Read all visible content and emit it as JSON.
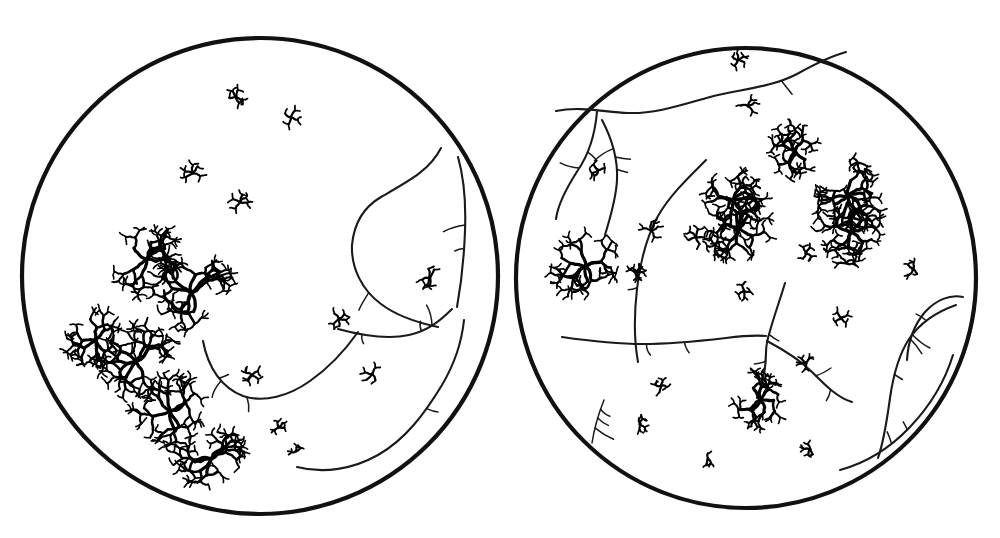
{
  "figure": {
    "background_color": "#ffffff",
    "ink_color": "#111111",
    "width": 1000,
    "height": 538,
    "caption": "",
    "labels": []
  },
  "fields": [
    {
      "id": "left-field",
      "name": "Left field of view",
      "center_x": 260,
      "center_y": 276,
      "radius": 238,
      "outline_width": 4.2,
      "cell_count": 16,
      "vessel_count": 4
    },
    {
      "id": "right-field",
      "name": "Right field of view",
      "center_x": 746,
      "center_y": 278,
      "radius": 230,
      "outline_width": 4.2,
      "cell_count": 25,
      "vessel_count": 7
    }
  ],
  "chart_data": {
    "type": "scatter",
    "xlabel": "",
    "ylabel": "",
    "legend": [
      {
        "key": "dense-cluster",
        "label": "Dense dendritic cell (highly ramified)"
      },
      {
        "key": "sparse-cell",
        "label": "Sparse stellate cell (few processes)"
      },
      {
        "key": "vessel",
        "label": "Blood vessel / fibre tract"
      }
    ],
    "series": [
      {
        "name": "left-field-cells",
        "field": "left-field",
        "points": [
          {
            "x": 236,
            "y": 97,
            "size": 1.0,
            "kind": "sparse-cell",
            "arms": 5,
            "rot": 14
          },
          {
            "x": 291,
            "y": 117,
            "size": 1.05,
            "kind": "sparse-cell",
            "arms": 4,
            "rot": 200
          },
          {
            "x": 193,
            "y": 173,
            "size": 1.15,
            "kind": "sparse-cell",
            "arms": 5,
            "rot": 120
          },
          {
            "x": 240,
            "y": 202,
            "size": 1.1,
            "kind": "sparse-cell",
            "arms": 5,
            "rot": 255
          },
          {
            "x": 147,
            "y": 259,
            "size": 2.45,
            "kind": "dense-cluster",
            "arms": 7,
            "rot": 30
          },
          {
            "x": 191,
            "y": 293,
            "size": 2.7,
            "kind": "dense-cluster",
            "arms": 8,
            "rot": 95
          },
          {
            "x": 96,
            "y": 341,
            "size": 1.95,
            "kind": "dense-cluster",
            "arms": 6,
            "rot": 210
          },
          {
            "x": 136,
            "y": 361,
            "size": 2.55,
            "kind": "dense-cluster",
            "arms": 8,
            "rot": 150
          },
          {
            "x": 170,
            "y": 411,
            "size": 2.5,
            "kind": "dense-cluster",
            "arms": 7,
            "rot": 320
          },
          {
            "x": 211,
            "y": 459,
            "size": 2.3,
            "kind": "dense-cluster",
            "arms": 7,
            "rot": 60
          },
          {
            "x": 252,
            "y": 375,
            "size": 1.0,
            "kind": "sparse-cell",
            "arms": 5,
            "rot": 180
          },
          {
            "x": 279,
            "y": 427,
            "size": 0.8,
            "kind": "sparse-cell",
            "arms": 4,
            "rot": 40
          },
          {
            "x": 372,
            "y": 374,
            "size": 1.05,
            "kind": "sparse-cell",
            "arms": 4,
            "rot": 280
          },
          {
            "x": 339,
            "y": 319,
            "size": 1.05,
            "kind": "sparse-cell",
            "arms": 5,
            "rot": 100
          },
          {
            "x": 430,
            "y": 277,
            "size": 1.2,
            "kind": "sparse-cell",
            "arms": 5,
            "rot": 330
          },
          {
            "x": 296,
            "y": 451,
            "size": 0.7,
            "kind": "sparse-cell",
            "arms": 3,
            "rot": 15
          }
        ]
      },
      {
        "name": "right-field-cells",
        "field": "right-field",
        "points": [
          {
            "x": 738,
            "y": 60,
            "size": 0.95,
            "kind": "sparse-cell",
            "arms": 5,
            "rot": 45
          },
          {
            "x": 748,
            "y": 106,
            "size": 1.05,
            "kind": "sparse-cell",
            "arms": 4,
            "rot": 160
          },
          {
            "x": 598,
            "y": 170,
            "size": 1.0,
            "kind": "sparse-cell",
            "arms": 4,
            "rot": 250
          },
          {
            "x": 795,
            "y": 151,
            "size": 1.85,
            "kind": "dense-cluster",
            "arms": 6,
            "rot": 25
          },
          {
            "x": 733,
            "y": 200,
            "size": 2.05,
            "kind": "dense-cluster",
            "arms": 7,
            "rot": 130
          },
          {
            "x": 739,
            "y": 228,
            "size": 2.15,
            "kind": "dense-cluster",
            "arms": 7,
            "rot": 290
          },
          {
            "x": 858,
            "y": 163,
            "size": 1.05,
            "kind": "sparse-cell",
            "arms": 4,
            "rot": 70
          },
          {
            "x": 848,
            "y": 196,
            "size": 2.25,
            "kind": "dense-cluster",
            "arms": 8,
            "rot": 10
          },
          {
            "x": 851,
            "y": 232,
            "size": 2.1,
            "kind": "dense-cluster",
            "arms": 7,
            "rot": 195
          },
          {
            "x": 846,
            "y": 263,
            "size": 1.1,
            "kind": "sparse-cell",
            "arms": 4,
            "rot": 320
          },
          {
            "x": 586,
            "y": 266,
            "size": 2.2,
            "kind": "dense-cluster",
            "arms": 8,
            "rot": 75
          },
          {
            "x": 696,
            "y": 237,
            "size": 1.15,
            "kind": "sparse-cell",
            "arms": 5,
            "rot": 140
          },
          {
            "x": 715,
            "y": 245,
            "size": 1.2,
            "kind": "sparse-cell",
            "arms": 5,
            "rot": 20
          },
          {
            "x": 651,
            "y": 230,
            "size": 1.15,
            "kind": "sparse-cell",
            "arms": 5,
            "rot": 225
          },
          {
            "x": 637,
            "y": 272,
            "size": 0.85,
            "kind": "sparse-cell",
            "arms": 4,
            "rot": 300
          },
          {
            "x": 806,
            "y": 253,
            "size": 0.95,
            "kind": "sparse-cell",
            "arms": 4,
            "rot": 110
          },
          {
            "x": 913,
            "y": 269,
            "size": 0.95,
            "kind": "sparse-cell",
            "arms": 4,
            "rot": 30
          },
          {
            "x": 635,
            "y": 272,
            "size": 0.8,
            "kind": "sparse-cell",
            "arms": 3,
            "rot": 190
          },
          {
            "x": 744,
            "y": 291,
            "size": 0.9,
            "kind": "sparse-cell",
            "arms": 4,
            "rot": 260
          },
          {
            "x": 841,
            "y": 318,
            "size": 0.95,
            "kind": "sparse-cell",
            "arms": 4,
            "rot": 80
          },
          {
            "x": 661,
            "y": 386,
            "size": 0.9,
            "kind": "sparse-cell",
            "arms": 4,
            "rot": 350
          },
          {
            "x": 760,
            "y": 400,
            "size": 1.9,
            "kind": "dense-cluster",
            "arms": 7,
            "rot": 55
          },
          {
            "x": 806,
            "y": 363,
            "size": 0.85,
            "kind": "sparse-cell",
            "arms": 4,
            "rot": 170
          },
          {
            "x": 640,
            "y": 424,
            "size": 0.85,
            "kind": "sparse-cell",
            "arms": 4,
            "rot": 215
          },
          {
            "x": 708,
            "y": 459,
            "size": 0.8,
            "kind": "sparse-cell",
            "arms": 3,
            "rot": 125
          },
          {
            "x": 810,
            "y": 449,
            "size": 0.85,
            "kind": "sparse-cell",
            "arms": 4,
            "rot": 305
          }
        ]
      }
    ],
    "vessels": [
      {
        "field": "left-field",
        "id": "left-vessel-upper-lobe",
        "path": "M 441,148 C 430,170 409,181 381,197 C 364,207 354,223 352,245 C 351,268 362,290 381,304 C 398,317 419,323 438,327",
        "width": 2.1
      },
      {
        "field": "left-field",
        "id": "left-vessel-right-arc",
        "path": "M 458,157 C 464,178 466,205 465,231 C 464,258 461,285 457,307",
        "width": 2.1
      },
      {
        "field": "left-field",
        "id": "left-vessel-branch-node",
        "path": "M 338,329 C 360,335 386,340 409,335 C 428,331 441,320 452,309",
        "width": 2.1
      },
      {
        "field": "left-field",
        "id": "left-vessel-lower-sweep",
        "path": "M 297,467 C 324,474 353,469 378,455 C 406,439 425,413 442,385 C 455,363 462,340 464,320",
        "width": 2.1
      },
      {
        "field": "left-field",
        "id": "left-vessel-valley",
        "path": "M 203,341 C 208,368 222,388 243,396 C 264,403 289,396 310,381 C 330,367 346,349 358,332",
        "width": 2.1
      },
      {
        "field": "right-field",
        "id": "right-vessel-top-ridge",
        "path": "M 556,111 C 580,106 604,112 628,113 C 656,114 684,104 710,97 C 740,89 770,88 797,74 C 815,64 831,56 846,52",
        "width": 2.1
      },
      {
        "field": "right-field",
        "id": "right-vessel-upper-left-node",
        "path": "M 597,112 C 595,134 589,154 578,170 C 567,187 558,203 556,219",
        "width": 2.1
      },
      {
        "field": "right-field",
        "id": "right-vessel-left-lobe",
        "path": "M 602,120 C 612,139 618,160 617,180 C 616,200 610,218 605,235",
        "width": 2.1
      },
      {
        "field": "right-field",
        "id": "right-vessel-central-diagonal",
        "path": "M 706,160 C 688,178 670,195 658,216 C 646,238 640,263 637,289 C 634,315 634,340 638,362",
        "width": 2.1
      },
      {
        "field": "right-field",
        "id": "right-vessel-mid-horizontal",
        "path": "M 562,337 C 590,341 617,344 643,344 C 672,344 700,341 726,338 C 742,336 755,335 766,336",
        "width": 2.1
      },
      {
        "field": "right-field",
        "id": "right-vessel-junction-stem",
        "path": "M 785,283 C 780,300 774,316 770,331 C 767,340 766,347 766,353 C 766,369 762,385 757,398",
        "width": 2.1
      },
      {
        "field": "right-field",
        "id": "right-vessel-junction-branch",
        "path": "M 767,341 C 784,350 800,360 812,372 C 826,386 838,398 852,402",
        "width": 2.1
      },
      {
        "field": "right-field",
        "id": "right-vessel-lower-right-lobe",
        "path": "M 956,305 C 936,312 920,323 909,339 C 898,356 893,377 890,398 C 887,420 884,441 878,458",
        "width": 2.1
      },
      {
        "field": "right-field",
        "id": "right-vessel-lower-right-arc",
        "path": "M 963,297 C 950,294 936,300 925,312 C 914,325 908,342 907,360",
        "width": 2.1
      },
      {
        "field": "right-field",
        "id": "right-vessel-lower-sweep",
        "path": "M 840,470 C 866,463 890,448 910,427 C 930,406 945,381 953,355",
        "width": 2.1
      },
      {
        "field": "right-field",
        "id": "right-vessel-left-descending",
        "path": "M 604,400 C 598,415 594,430 592,443",
        "width": 1.5
      }
    ]
  },
  "legend_hidden": true
}
